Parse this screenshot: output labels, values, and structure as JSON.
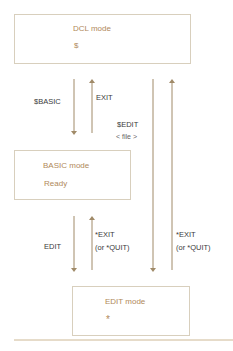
{
  "boxes": {
    "dcl": {
      "mode": "DCL mode",
      "prompt": "$"
    },
    "basic": {
      "mode": "BASIC mode",
      "prompt": "Ready"
    },
    "edit": {
      "mode": "EDIT mode",
      "prompt": "*"
    }
  },
  "transitions": {
    "dcl_to_basic": "$BASIC",
    "basic_to_dcl": "EXIT",
    "dcl_to_edit_cmd": "$EDIT",
    "dcl_to_edit_arg": "< file >",
    "basic_to_edit": "EDIT",
    "edit_to_basic_1": "*EXIT",
    "edit_to_basic_2": "(or *QUIT)",
    "edit_to_dcl_1": "*EXIT",
    "edit_to_dcl_2": "(or *QUIT)"
  },
  "colors": {
    "arrow": "#a08a68",
    "mode_text": "#b0895a",
    "box_border": "#d8cfbd"
  }
}
